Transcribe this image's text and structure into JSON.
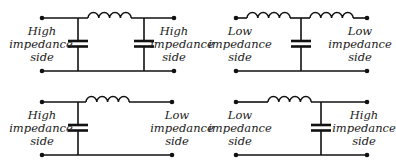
{
  "diagram": {
    "panels": [
      {
        "id": "pi-network",
        "left_label": [
          "High",
          "impedance",
          "side"
        ],
        "right_label": [
          "High",
          "impedance",
          "side"
        ]
      },
      {
        "id": "t-network",
        "left_label": [
          "Low",
          "impedance",
          "side"
        ],
        "right_label": [
          "Low",
          "impedance",
          "side"
        ]
      },
      {
        "id": "l-network-high-to-low",
        "left_label": [
          "High",
          "impedance",
          "side"
        ],
        "right_label": [
          "Low",
          "impedance",
          "side"
        ]
      },
      {
        "id": "l-network-low-to-high",
        "left_label": [
          "Low",
          "impedance",
          "side"
        ],
        "right_label": [
          "High",
          "impedance",
          "side"
        ]
      }
    ],
    "colors": {
      "line": "#111111",
      "text": "#222222",
      "background": "#ffffff"
    }
  }
}
